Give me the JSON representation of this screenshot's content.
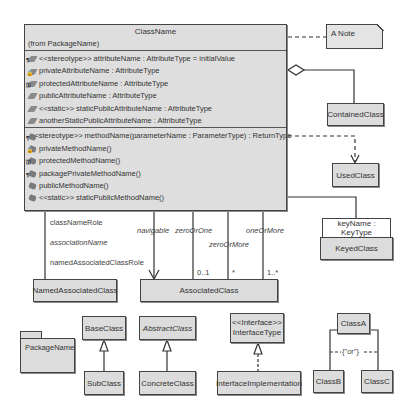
{
  "main_class": {
    "name": "ClassName",
    "from": "(from PackageName)",
    "attributes": [
      {
        "icon": "stereotype-attribute-icon",
        "text": "<<stereotype>> attributeName : AttributeType = initialValue"
      },
      {
        "icon": "private-attribute-icon",
        "text": "privateAttributeName : AttributeType"
      },
      {
        "icon": "protected-attribute-icon",
        "text": "protectedAttributeName : AttributeType"
      },
      {
        "icon": "public-attribute-icon",
        "text": "publicAttributeName : AttributeType"
      },
      {
        "icon": "static-attribute-icon",
        "text": "<<static>> staticPublicAttributeName : AttributeType"
      },
      {
        "icon": "static-attribute-icon",
        "text": "anotherStaticPublicAttributeName : AttributeType"
      }
    ],
    "methods": [
      {
        "icon": "stereotype-method-icon",
        "text": "<<stereotype>> methodName(parameterName : ParameterType) : ReturnType"
      },
      {
        "icon": "private-method-icon",
        "text": "privateMethodName()"
      },
      {
        "icon": "protected-method-icon",
        "text": "protectedMethodName()"
      },
      {
        "icon": "package-method-icon",
        "text": "packagePrivateMethodName()"
      },
      {
        "icon": "public-method-icon",
        "text": "publicMethodName()"
      },
      {
        "icon": "static-method-icon",
        "text": "<<static>> staticPublicMethodName()"
      }
    ]
  },
  "note": {
    "text": "A Note"
  },
  "contained_class": {
    "name": "ContainedClass"
  },
  "used_class": {
    "name": "UsedClass"
  },
  "keyed_class": {
    "name": "KeyedClass",
    "qualifier": "keyName : KeyType"
  },
  "named_associated_class": {
    "name": "NamedAssociatedClass",
    "labels": {
      "role": "classNameRole",
      "association": "associationName",
      "target_role": "namedAssociatedClassRole"
    }
  },
  "associated_class": {
    "name": "AssociatedClass",
    "links": [
      {
        "label": "navigable",
        "multiplicity": ""
      },
      {
        "label": "zeroOrOne",
        "multiplicity": "0..1"
      },
      {
        "label": "zeroOrMore",
        "multiplicity": "*"
      },
      {
        "label": "oneOrMore",
        "multiplicity": "1..*"
      }
    ]
  },
  "package": {
    "name": "PackageName"
  },
  "inheritance": {
    "base": "BaseClass",
    "sub": "SubClass"
  },
  "abstract": {
    "abstract": "AbstractClass",
    "concrete": "ConcreteClass"
  },
  "interface": {
    "stereotype": "<<Interface>>",
    "name": "InterfaceType",
    "implementation": "InterfaceImplementation"
  },
  "xor": {
    "parent": "ClassA",
    "left": "ClassB",
    "right": "ClassC",
    "constraint": "{\"or\"}"
  }
}
